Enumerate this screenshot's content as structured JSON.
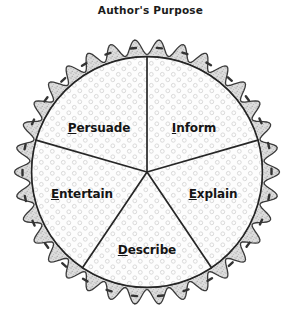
{
  "title": "Author's Purpose",
  "figure": {
    "name": "pie-chart-authors-purpose",
    "shape": "pie-with-crust",
    "crust": {
      "fill_color": "#dedede",
      "outline_color": "#3a3a3a",
      "dash_color": "#3a3a3a",
      "scallops": 34
    },
    "filling": {
      "fill_color": "#fdfdfd",
      "bubble_color": "#d8d8d8",
      "divider_color": "#262626"
    },
    "slices": [
      {
        "id": "persuade",
        "label": "Persuade",
        "initial": "P",
        "rest": "ersuade",
        "label_x": 99,
        "label_y": 106
      },
      {
        "id": "inform",
        "label": "Inform",
        "initial": "I",
        "rest": "nform",
        "label_x": 194,
        "label_y": 106
      },
      {
        "id": "explain",
        "label": "Explain",
        "initial": "E",
        "rest": "xplain",
        "label_x": 213,
        "label_y": 172
      },
      {
        "id": "describe",
        "label": "Describe",
        "initial": "D",
        "rest": "escribe",
        "label_x": 147,
        "label_y": 228
      },
      {
        "id": "entertain",
        "label": "Entertain",
        "initial": "E",
        "rest": "ntertain",
        "label_x": 82,
        "label_y": 172
      }
    ]
  }
}
